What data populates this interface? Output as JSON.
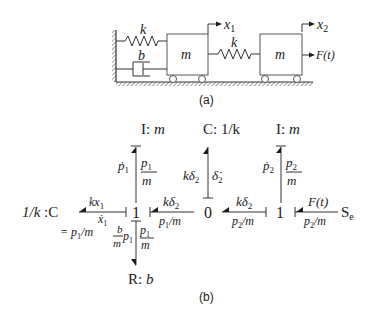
{
  "figure_a": {
    "caption": "(a)",
    "spring_left_label": "k",
    "damper_label": "b",
    "mass1_label": "m",
    "spring_middle_label": "k",
    "mass2_label": "m",
    "x1_label": "x",
    "x1_sub": "1",
    "x2_label": "x",
    "x2_sub": "2",
    "force_label": "F(t)"
  },
  "figure_b": {
    "caption": "(b)",
    "nodes": {
      "I_left": {
        "type": "I:",
        "param": "m"
      },
      "C_top": {
        "type": "C:",
        "param": "1/k"
      },
      "I_right": {
        "type": "I:",
        "param": "m"
      },
      "C_left": {
        "param": "1/k",
        "type": ":C"
      },
      "junction_1_left": "1",
      "junction_0": "0",
      "junction_1_right": "1",
      "source": {
        "main": "S",
        "sub": "e"
      },
      "R_bottom": {
        "type": "R:",
        "param": "b"
      }
    },
    "bonds": {
      "I_left": {
        "effort": "ṗ",
        "effort_sub": "1",
        "flow_num": "p",
        "flow_num_sub": "1",
        "flow_den": "m"
      },
      "C_left": {
        "effort": "kx",
        "effort_sub": "1",
        "flow_top": "ẋ",
        "flow_top_sub": "1",
        "flow_bottom": "= p",
        "flow_bottom_sub": "1",
        "flow_bottom_rest": "/m"
      },
      "R_bottom": {
        "effort_num": "b",
        "effort_den": "m",
        "effort_p": "p",
        "effort_sub": "1",
        "flow_num": "p",
        "flow_num_sub": "1",
        "flow_den": "m"
      },
      "one_to_zero": {
        "effort": "kδ",
        "effort_sub": "2",
        "flow": "p",
        "flow_sub": "1",
        "flow_rest": "/m"
      },
      "C_top": {
        "effort": "kδ",
        "effort_sub": "2",
        "flow": "δ̇",
        "flow_sub": "2"
      },
      "zero_to_one": {
        "effort": "kδ",
        "effort_sub": "2",
        "flow": "p",
        "flow_sub": "2",
        "flow_rest": "/m"
      },
      "I_right": {
        "effort": "ṗ",
        "effort_sub": "2",
        "flow_num": "p",
        "flow_num_sub": "2",
        "flow_den": "m"
      },
      "source": {
        "effort": "F(t)",
        "flow": "p",
        "flow_sub": "2",
        "flow_rest": "/m"
      }
    }
  }
}
